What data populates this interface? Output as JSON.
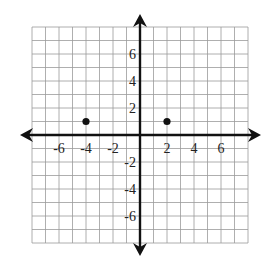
{
  "chart_data": {
    "type": "scatter",
    "title": "",
    "xlabel": "",
    "ylabel": "",
    "xlim": [
      -8,
      8
    ],
    "ylim": [
      -8,
      8
    ],
    "grid": true,
    "grid_step": 1,
    "axes_arrows": true,
    "x_tick_labels": [
      "-6",
      "-4",
      "-2",
      "2",
      "4",
      "6"
    ],
    "x_tick_values": [
      -6,
      -4,
      -2,
      2,
      4,
      6
    ],
    "y_tick_labels": [
      "6",
      "4",
      "2",
      "-2",
      "-4",
      "-6"
    ],
    "y_tick_values": [
      6,
      4,
      2,
      -2,
      -4,
      -6
    ],
    "points": [
      {
        "x": -4,
        "y": 1
      },
      {
        "x": 2,
        "y": 1
      }
    ],
    "colors": {
      "grid": "#9a9a9a",
      "axis": "#111111",
      "point": "#111111"
    }
  }
}
